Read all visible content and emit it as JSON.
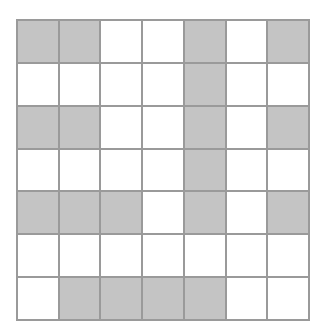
{
  "figure": {
    "type": "grid-pattern",
    "rows": 7,
    "columns": 7,
    "cell_states": {
      "filled": "shaded",
      "empty": "white"
    }
  },
  "colors": {
    "page_background": "#ffffff",
    "cell_fill_shaded": "#c4c4c4",
    "cell_fill_empty": "#ffffff",
    "grid_line": "#9a9a9a"
  },
  "chart_data": {
    "type": "heatmap",
    "xlabel": "",
    "ylabel": "",
    "categories_x": [
      "1",
      "2",
      "3",
      "4",
      "5",
      "6",
      "7"
    ],
    "categories_y": [
      "1",
      "2",
      "3",
      "4",
      "5",
      "6",
      "7"
    ],
    "legend": [
      {
        "label": "shaded",
        "value": 1,
        "color": "#c4c4c4"
      },
      {
        "label": "white",
        "value": 0,
        "color": "#ffffff"
      }
    ],
    "grid": true,
    "values": [
      [
        1,
        1,
        0,
        0,
        1,
        0,
        1
      ],
      [
        0,
        0,
        0,
        0,
        1,
        0,
        0
      ],
      [
        1,
        1,
        0,
        0,
        1,
        0,
        1
      ],
      [
        0,
        0,
        0,
        0,
        1,
        0,
        0
      ],
      [
        1,
        1,
        1,
        0,
        1,
        0,
        1
      ],
      [
        0,
        0,
        0,
        0,
        0,
        0,
        0
      ],
      [
        0,
        1,
        1,
        1,
        1,
        0,
        0
      ]
    ],
    "shaded_count": 21,
    "empty_count": 28,
    "total_cells": 49
  },
  "rows": [
    {
      "index": 1,
      "cells": [
        {
          "col": 1,
          "state": "shaded"
        },
        {
          "col": 2,
          "state": "shaded"
        },
        {
          "col": 3,
          "state": "white"
        },
        {
          "col": 4,
          "state": "white"
        },
        {
          "col": 5,
          "state": "shaded"
        },
        {
          "col": 6,
          "state": "white"
        },
        {
          "col": 7,
          "state": "shaded"
        }
      ]
    },
    {
      "index": 2,
      "cells": [
        {
          "col": 1,
          "state": "white"
        },
        {
          "col": 2,
          "state": "white"
        },
        {
          "col": 3,
          "state": "white"
        },
        {
          "col": 4,
          "state": "white"
        },
        {
          "col": 5,
          "state": "shaded"
        },
        {
          "col": 6,
          "state": "white"
        },
        {
          "col": 7,
          "state": "white"
        }
      ]
    },
    {
      "index": 3,
      "cells": [
        {
          "col": 1,
          "state": "shaded"
        },
        {
          "col": 2,
          "state": "shaded"
        },
        {
          "col": 3,
          "state": "white"
        },
        {
          "col": 4,
          "state": "white"
        },
        {
          "col": 5,
          "state": "shaded"
        },
        {
          "col": 6,
          "state": "white"
        },
        {
          "col": 7,
          "state": "shaded"
        }
      ]
    },
    {
      "index": 4,
      "cells": [
        {
          "col": 1,
          "state": "white"
        },
        {
          "col": 2,
          "state": "white"
        },
        {
          "col": 3,
          "state": "white"
        },
        {
          "col": 4,
          "state": "white"
        },
        {
          "col": 5,
          "state": "shaded"
        },
        {
          "col": 6,
          "state": "white"
        },
        {
          "col": 7,
          "state": "white"
        }
      ]
    },
    {
      "index": 5,
      "cells": [
        {
          "col": 1,
          "state": "shaded"
        },
        {
          "col": 2,
          "state": "shaded"
        },
        {
          "col": 3,
          "state": "shaded"
        },
        {
          "col": 4,
          "state": "white"
        },
        {
          "col": 5,
          "state": "shaded"
        },
        {
          "col": 6,
          "state": "white"
        },
        {
          "col": 7,
          "state": "shaded"
        }
      ]
    },
    {
      "index": 6,
      "cells": [
        {
          "col": 1,
          "state": "white"
        },
        {
          "col": 2,
          "state": "white"
        },
        {
          "col": 3,
          "state": "white"
        },
        {
          "col": 4,
          "state": "white"
        },
        {
          "col": 5,
          "state": "white"
        },
        {
          "col": 6,
          "state": "white"
        },
        {
          "col": 7,
          "state": "white"
        }
      ]
    },
    {
      "index": 7,
      "cells": [
        {
          "col": 1,
          "state": "white"
        },
        {
          "col": 2,
          "state": "shaded"
        },
        {
          "col": 3,
          "state": "shaded"
        },
        {
          "col": 4,
          "state": "shaded"
        },
        {
          "col": 5,
          "state": "shaded"
        },
        {
          "col": 6,
          "state": "white"
        },
        {
          "col": 7,
          "state": "white"
        }
      ]
    }
  ]
}
